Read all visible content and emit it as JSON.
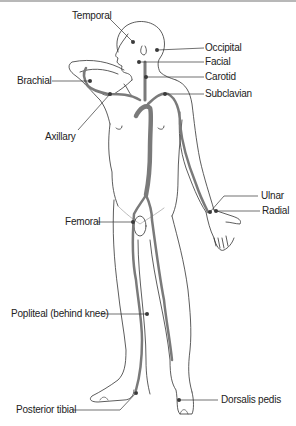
{
  "labels": {
    "temporal": "Temporal",
    "occipital": "Occipital",
    "facial": "Facial",
    "carotid": "Carotid",
    "subclavian": "Subclavian",
    "brachial": "Brachial",
    "axillary": "Axillary",
    "ulnar": "Ulnar",
    "radial": "Radial",
    "femoral": "Femoral",
    "popliteal": "Popliteal (behind knee)",
    "posterior_tibial": "Posterior tibial",
    "dorsalis_pedis": "Dorsalis pedis"
  },
  "colors": {
    "outline": "#333333",
    "artery": "#7a7a7a",
    "pulse_point": "#3a3a3a",
    "leader_line": "#333333"
  }
}
